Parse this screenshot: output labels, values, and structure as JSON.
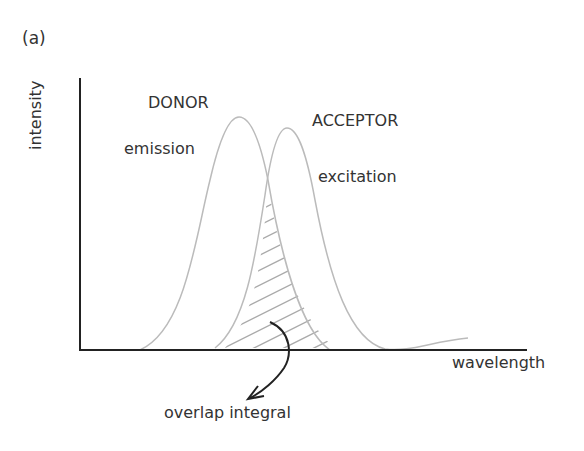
{
  "panel_label": "(a)",
  "y_axis_label": "intensity",
  "x_axis_label": "wavelength",
  "donor": {
    "title": "DONOR",
    "subtitle": "emission"
  },
  "acceptor": {
    "title": "ACCEPTOR",
    "subtitle": "excitation"
  },
  "annotation": "overlap integral",
  "colors": {
    "axis": "#222222",
    "curve": "#bbbbbb",
    "hatch": "#aaaaaa",
    "arrow": "#222222"
  }
}
